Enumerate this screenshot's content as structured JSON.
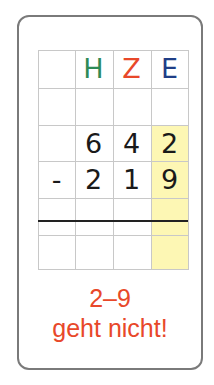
{
  "header": {
    "columns": [
      {
        "label": "",
        "color": "#000000"
      },
      {
        "label": "H",
        "color": "#2e8b57"
      },
      {
        "label": "Z",
        "color": "#e8482a"
      },
      {
        "label": "E",
        "color": "#1f3e86"
      }
    ]
  },
  "rows": {
    "minuend": {
      "sign": "",
      "digits": [
        "6",
        "4",
        "2"
      ]
    },
    "subtrahend": {
      "sign": "-",
      "digits": [
        "2",
        "1",
        "9"
      ]
    }
  },
  "highlight_column": "E",
  "highlight_color": "#fdf7b4",
  "message": {
    "line1": "2–9",
    "line2": "geht nicht!",
    "color": "#e8482a"
  }
}
